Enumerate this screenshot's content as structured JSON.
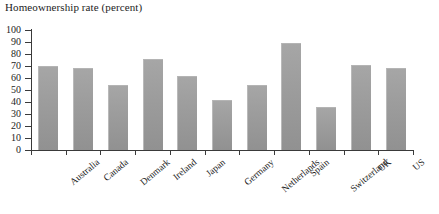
{
  "chart_data": {
    "type": "bar",
    "title": "Homeownership rate (percent)",
    "xlabel": "",
    "ylabel": "",
    "ylim": [
      0,
      100
    ],
    "ytick_step": 10,
    "yticks": [
      0,
      10,
      20,
      30,
      40,
      50,
      60,
      70,
      80,
      90,
      100
    ],
    "ytick_labels": [
      "0",
      "10",
      "20",
      "30",
      "40",
      "50",
      "60",
      "70",
      "80",
      "90",
      "100"
    ],
    "grid": false,
    "legend": false,
    "categories": [
      "Australia",
      "Canada",
      "Denmark",
      "Ireland",
      "Japan",
      "Germany",
      "Netherlands",
      "Spain",
      "Switzerland",
      "UK",
      "US"
    ],
    "values": [
      70,
      68,
      54,
      76,
      62,
      42,
      54,
      89,
      36,
      71,
      68
    ],
    "bar_color": "#9a9a9a",
    "axis_color": "#3a3a3a",
    "background": "#ffffff"
  }
}
